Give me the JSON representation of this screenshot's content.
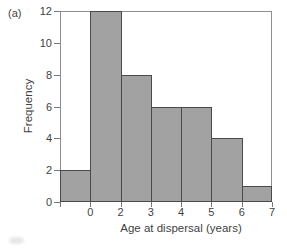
{
  "figure_label": "(a)",
  "chart_data": {
    "type": "bar",
    "title": "",
    "xlabel": "Age at dispersal (years)",
    "ylabel": "Frequency",
    "values": [
      2,
      12,
      8,
      6,
      6,
      4,
      1
    ],
    "bar_right_edge_labels": [
      "0",
      "2",
      "3",
      "4",
      "5",
      "6",
      "7"
    ],
    "y_ticks": [
      0,
      2,
      4,
      6,
      8,
      10,
      12
    ],
    "ylim": [
      0,
      12
    ],
    "grid": false,
    "legend": false
  },
  "colors": {
    "bar_fill": "#a2a2a2",
    "bar_border": "#4a4a4a",
    "frame": "#8f8f8f",
    "tick": "#787878",
    "text": "#3f3f3f",
    "background": "#ffffff"
  }
}
